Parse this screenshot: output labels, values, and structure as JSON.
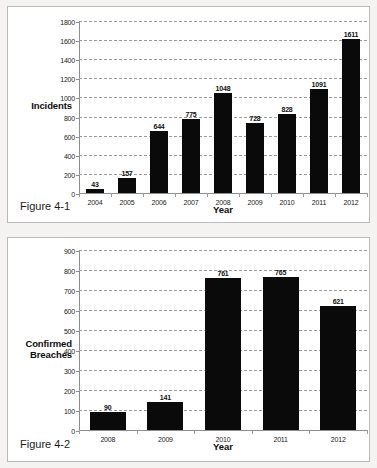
{
  "page": {
    "background": "#f4f3f1",
    "panel_background": "#ffffff",
    "bar_color": "#0a0a0a",
    "grid_color": "#9a9a9a"
  },
  "figures": [
    {
      "caption": "Figure 4-1",
      "y_title": "Incidents",
      "x_title": "Year"
    },
    {
      "caption": "Figure 4-2",
      "y_title_line1": "Confirmed",
      "y_title_line2": "Breaches",
      "x_title": "Year"
    }
  ],
  "chart_data": [
    {
      "type": "bar",
      "title": "Figure 4-1",
      "xlabel": "Year",
      "ylabel": "Incidents",
      "categories": [
        "2004",
        "2005",
        "2006",
        "2007",
        "2008",
        "2009",
        "2010",
        "2011",
        "2012"
      ],
      "values": [
        43,
        157,
        644,
        775,
        1048,
        728,
        828,
        1091,
        1611
      ],
      "value_labels": [
        "43",
        "157",
        "644",
        "775",
        "1048",
        "728",
        "828",
        "1091",
        "1611"
      ],
      "ylim": [
        0,
        1800
      ],
      "ytick_step": 200,
      "yticks": [
        "1800",
        "1600",
        "1400",
        "1200",
        "1000",
        "800",
        "600",
        "400",
        "200",
        "0"
      ],
      "grid": true,
      "legend": false,
      "bar_color": "#0a0a0a"
    },
    {
      "type": "bar",
      "title": "Figure 4-2",
      "xlabel": "Year",
      "ylabel": "Confirmed Breaches",
      "categories": [
        "2008",
        "2009",
        "2010",
        "2011",
        "2012"
      ],
      "values": [
        90,
        141,
        761,
        765,
        621
      ],
      "value_labels": [
        "90",
        "141",
        "761",
        "765",
        "621"
      ],
      "ylim": [
        0,
        900
      ],
      "ytick_step": 100,
      "yticks": [
        "900",
        "800",
        "700",
        "600",
        "500",
        "400",
        "300",
        "200",
        "100",
        "0"
      ],
      "grid": true,
      "legend": false,
      "bar_color": "#0a0a0a"
    }
  ]
}
